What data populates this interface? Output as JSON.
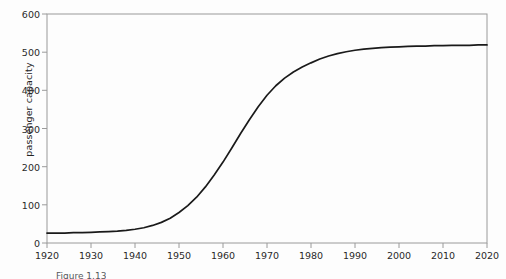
{
  "chart_data": {
    "type": "line",
    "title": "",
    "subtitle": "",
    "xlabel": "",
    "ylabel": "passenger capacity",
    "xlim": [
      1920,
      2020
    ],
    "ylim": [
      0,
      600
    ],
    "grid": false,
    "legend": null,
    "legend_position": "none",
    "line_color": "#1a1a1a",
    "axis_color": "#8c8c8c",
    "background_color": "#fdfdfd",
    "x_ticks": [
      1920,
      1930,
      1940,
      1950,
      1960,
      1970,
      1980,
      1990,
      2000,
      2010,
      2020
    ],
    "x_tick_labels": [
      "1920",
      "1930",
      "1940",
      "1950",
      "1960",
      "1970",
      "1980",
      "1990",
      "2000",
      "2010",
      "2020"
    ],
    "y_ticks": [
      0,
      100,
      200,
      300,
      400,
      500,
      600
    ],
    "y_tick_labels": [
      "0",
      "100",
      "200",
      "300",
      "400",
      "500",
      "600"
    ],
    "series": [
      {
        "name": "passenger capacity",
        "x": [
          1920,
          1922,
          1924,
          1926,
          1928,
          1930,
          1932,
          1934,
          1936,
          1938,
          1940,
          1942,
          1944,
          1946,
          1948,
          1950,
          1952,
          1954,
          1956,
          1958,
          1960,
          1962,
          1964,
          1966,
          1968,
          1970,
          1972,
          1974,
          1976,
          1978,
          1980,
          1982,
          1984,
          1986,
          1988,
          1990,
          1992,
          1994,
          1996,
          1998,
          2000,
          2002,
          2004,
          2006,
          2008,
          2010,
          2012,
          2014,
          2016,
          2018,
          2020
        ],
        "values": [
          26,
          26,
          26,
          27,
          27,
          28,
          29,
          30,
          31,
          33,
          36,
          40,
          46,
          54,
          65,
          80,
          98,
          120,
          147,
          178,
          212,
          249,
          287,
          323,
          357,
          387,
          412,
          432,
          448,
          461,
          472,
          482,
          490,
          496,
          501,
          505,
          508,
          510,
          512,
          513,
          514,
          515,
          516,
          516,
          517,
          517,
          518,
          518,
          518,
          519,
          519
        ]
      }
    ],
    "annotations": {
      "start_value": 26,
      "plateau_value": 519,
      "inflection_year": 1963
    }
  },
  "caption": {
    "text": "Figure 1.13"
  }
}
